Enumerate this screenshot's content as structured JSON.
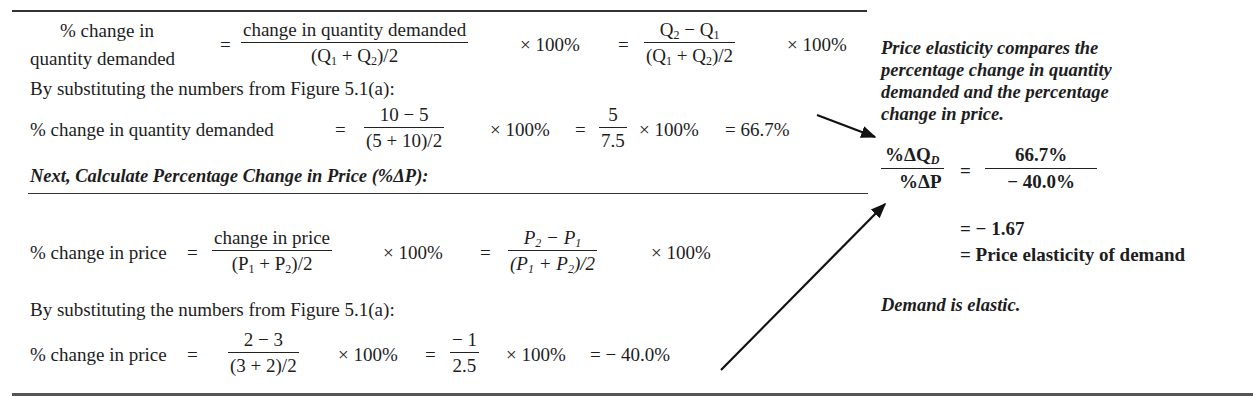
{
  "quantity_section": {
    "lhs_line1": "% change in",
    "lhs_line2": "quantity demanded",
    "eq": "=",
    "frac1_num": "change in quantity demanded",
    "frac1_den_open": "(Q",
    "frac1_den_plus": " + Q",
    "frac1_den_close": ")/2",
    "times100": "× 100%",
    "eq2": "=",
    "frac2_num_a": "Q",
    "frac2_num_minus": " − Q",
    "sub1": "1",
    "sub2": "2",
    "times100_b": "× 100%",
    "substituting": "By substituting the numbers from Figure 5.1(a):",
    "calc_lhs": "% change in quantity demanded",
    "calc_eq": "=",
    "calc_frac1_num": "10 − 5",
    "calc_frac1_den": "(5 + 10)/2",
    "calc_times": "× 100%",
    "calc_eq2": "=",
    "calc_frac2_num": "5",
    "calc_frac2_den": "7.5",
    "calc_times2": "× 100%",
    "calc_result": "= 66.7%"
  },
  "price_heading": "Next, Calculate Percentage Change in Price (%ΔP):",
  "price_section": {
    "lhs": "% change in price",
    "eq": "=",
    "frac1_num": "change in price",
    "frac1_den_open": "(P",
    "frac1_den_plus": " + P",
    "frac1_den_close": ")/2",
    "times100": "× 100%",
    "eq2": "=",
    "frac2_num_a": "P",
    "frac2_num_minus": " − P",
    "sub1": "1",
    "sub2": "2",
    "times100_b": "× 100%",
    "substituting": "By substituting the numbers from Figure 5.1(a):",
    "calc_lhs": "% change in price",
    "calc_eq": "=",
    "calc_frac1_num": "2 − 3",
    "calc_frac1_den": "(3 + 2)/2",
    "calc_times": "× 100%",
    "calc_eq2": "=",
    "calc_frac2_num": "− 1",
    "calc_frac2_den": "2.5",
    "calc_times2": "× 100%",
    "calc_result": "= − 40.0%"
  },
  "sidebar": {
    "note_lines": [
      "Price elasticity compares the",
      "percentage change in quantity",
      "demanded and the percentage",
      "change in price."
    ],
    "ratio_num": "%ΔQ",
    "ratio_num_sub": "D",
    "ratio_den": "%ΔP",
    "eq": "=",
    "value_num": "66.7%",
    "value_den": "− 40.0%",
    "result_line": "=  − 1.67",
    "label_line": "= Price elasticity of demand",
    "conclusion": "Demand is elastic."
  }
}
